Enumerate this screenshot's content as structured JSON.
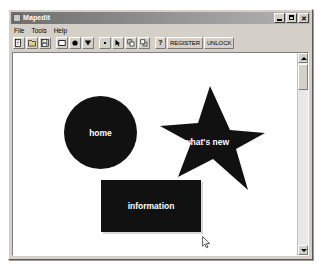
{
  "window": {
    "title": "Mapedit",
    "icon": "app-icon",
    "controls": [
      {
        "name": "minimize",
        "glyph": "_"
      },
      {
        "name": "maximize",
        "glyph": "□"
      },
      {
        "name": "close",
        "glyph": "✕"
      }
    ]
  },
  "menu": {
    "items": [
      {
        "label": "File"
      },
      {
        "label": "Tools"
      },
      {
        "label": "Help"
      }
    ]
  },
  "toolbar": {
    "file_group": [
      {
        "name": "new-file-button",
        "icon": "new-document-icon"
      },
      {
        "name": "open-file-button",
        "icon": "open-folder-icon"
      },
      {
        "name": "save-file-button",
        "icon": "floppy-disk-icon"
      }
    ],
    "shape_group": [
      {
        "name": "rectangle-tool-button",
        "icon": "rectangle-icon"
      },
      {
        "name": "circle-tool-button",
        "icon": "circle-icon"
      },
      {
        "name": "polygon-tool-button",
        "icon": "polygon-icon"
      }
    ],
    "edit_group": [
      {
        "name": "point-tool-button",
        "icon": "point-icon"
      },
      {
        "name": "arrow-tool-button",
        "icon": "arrow-icon"
      },
      {
        "name": "front-order-button",
        "icon": "bring-to-front-icon"
      },
      {
        "name": "back-order-button",
        "icon": "send-to-back-icon"
      }
    ],
    "help_button": {
      "name": "help-button",
      "label": "?"
    },
    "register_button": {
      "name": "register-button",
      "label": "REGISTER"
    },
    "unlock_button": {
      "name": "unlock-button",
      "label": "UNLOCK"
    }
  },
  "canvas": {
    "background_color": "#ffffff",
    "shape_fill_color": "#111111",
    "shape_label_color": "#ffffff",
    "shapes": [
      {
        "name": "circle-hotspot",
        "type": "circle",
        "label": "home"
      },
      {
        "name": "star-hotspot",
        "type": "polygon",
        "label": "what's new"
      },
      {
        "name": "rectangle-hotspot",
        "type": "rectangle",
        "label": "information"
      }
    ]
  },
  "scrollbar": {
    "up_arrow": "scroll-up-arrow",
    "down_arrow": "scroll-down-arrow",
    "thumb": "scroll-thumb"
  },
  "cursor": {
    "name": "mouse-pointer",
    "type": "arrow"
  }
}
